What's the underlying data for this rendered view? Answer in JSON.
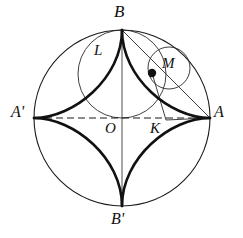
{
  "figure": {
    "type": "geometry-diagram",
    "background": "#ffffff",
    "stroke_color": "#111111",
    "thin_stroke": "#222222",
    "canvas": {
      "width": 243,
      "height": 238
    }
  },
  "geometry": {
    "center": {
      "x": 122,
      "y": 118
    },
    "outer_radius": 88,
    "rolling_radius": 44,
    "rolling_center": {
      "x": 122,
      "y": 74
    },
    "small_circle": {
      "cx": 169,
      "cy": 68,
      "r": 21
    },
    "point_M": {
      "x": 152,
      "y": 73
    },
    "point_K": {
      "x": 160,
      "y": 118
    },
    "point_L": {
      "x": 112,
      "y": 70
    },
    "cusps": {
      "A": {
        "x": 210,
        "y": 118
      },
      "B": {
        "x": 122,
        "y": 30
      },
      "Ap": {
        "x": 34,
        "y": 118
      },
      "Bp": {
        "x": 122,
        "y": 206
      }
    }
  },
  "labels": {
    "B": {
      "text": "B",
      "x": 115,
      "y": 5
    },
    "L": {
      "text": "L",
      "x": 95,
      "y": 45
    },
    "M": {
      "text": "M",
      "x": 163,
      "y": 57
    },
    "A": {
      "text": "A",
      "x": 215,
      "y": 105
    },
    "Aprime": {
      "text": "A'",
      "x": 13,
      "y": 105
    },
    "O": {
      "text": "O",
      "x": 108,
      "y": 122
    },
    "K": {
      "text": "K",
      "x": 152,
      "y": 122
    },
    "Bprime": {
      "text": "B'",
      "x": 113,
      "y": 212
    }
  }
}
